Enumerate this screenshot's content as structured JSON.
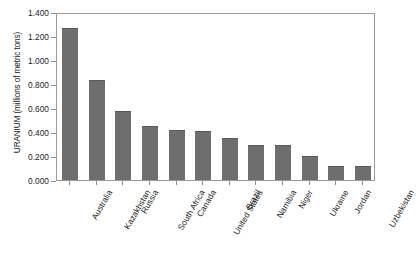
{
  "chart_data": {
    "type": "bar",
    "title": "",
    "xlabel": "",
    "ylabel": "URANIUM (millions of metric tons)",
    "ylim": [
      0.0,
      1.4
    ],
    "ytick_labels": [
      "1.400",
      "1.200",
      "1.000",
      "0.800",
      "0.600",
      "0.400",
      "0.200",
      "0.000"
    ],
    "ytick_values": [
      1.4,
      1.2,
      1.0,
      0.8,
      0.6,
      0.4,
      0.2,
      0.0
    ],
    "grid": false,
    "legend": "none",
    "bar_color": "#6e6e6e",
    "categories": [
      "Australia",
      "Kazakhstan",
      "Russia",
      "South Africa",
      "Canada",
      "United States",
      "Brazil",
      "Namibia",
      "Niger",
      "Ukraine",
      "Jordan",
      "Uzbekistan"
    ],
    "values": [
      1.27,
      0.835,
      0.575,
      0.45,
      0.415,
      0.41,
      0.35,
      0.29,
      0.29,
      0.2,
      0.115,
      0.115
    ]
  }
}
